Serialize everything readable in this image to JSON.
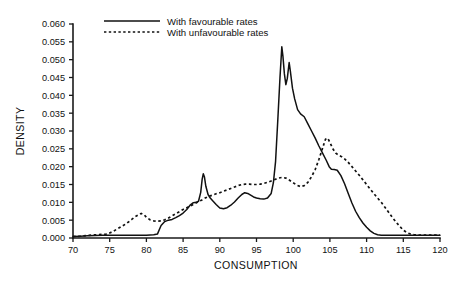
{
  "chart_data": {
    "type": "line",
    "title": "",
    "xlabel": "CONSUMPTION",
    "ylabel": "DENSITY",
    "xlim": [
      70,
      120
    ],
    "ylim": [
      0.0,
      0.06
    ],
    "grid": false,
    "legend_position": "top-center",
    "xticks": [
      70,
      75,
      80,
      85,
      90,
      95,
      100,
      105,
      110,
      115,
      120
    ],
    "xtick_labels": [
      "70",
      "75",
      "80",
      "85",
      "90",
      "95",
      "100",
      "105",
      "110",
      "115",
      "120"
    ],
    "yticks": [
      0.0,
      0.005,
      0.01,
      0.015,
      0.02,
      0.025,
      0.03,
      0.035,
      0.04,
      0.045,
      0.05,
      0.055,
      0.06
    ],
    "ytick_labels": [
      "0.000",
      "0.005",
      "0.010",
      "0.015",
      "0.020",
      "0.025",
      "0.030",
      "0.035",
      "0.040",
      "0.045",
      "0.050",
      "0.055",
      "0.060"
    ],
    "series": [
      {
        "name": "With favourable rates",
        "style": "solid",
        "color": "#111111",
        "points": [
          [
            70.0,
            0.0004
          ],
          [
            71.0,
            0.0005
          ],
          [
            72.0,
            0.0006
          ],
          [
            73.0,
            0.0007
          ],
          [
            74.0,
            0.0008
          ],
          [
            75.0,
            0.0008
          ],
          [
            76.0,
            0.0008
          ],
          [
            77.0,
            0.0008
          ],
          [
            78.0,
            0.0008
          ],
          [
            79.0,
            0.0008
          ],
          [
            80.0,
            0.0008
          ],
          [
            81.0,
            0.0009
          ],
          [
            81.5,
            0.0011
          ],
          [
            82.0,
            0.0035
          ],
          [
            82.5,
            0.0046
          ],
          [
            83.0,
            0.005
          ],
          [
            83.5,
            0.0052
          ],
          [
            84.0,
            0.0057
          ],
          [
            84.5,
            0.0063
          ],
          [
            85.0,
            0.007
          ],
          [
            85.5,
            0.008
          ],
          [
            86.0,
            0.0093
          ],
          [
            86.4,
            0.0099
          ],
          [
            86.8,
            0.01
          ],
          [
            87.1,
            0.0103
          ],
          [
            87.4,
            0.0128
          ],
          [
            87.6,
            0.0165
          ],
          [
            87.75,
            0.018
          ],
          [
            87.9,
            0.0172
          ],
          [
            88.1,
            0.0145
          ],
          [
            88.4,
            0.0122
          ],
          [
            88.7,
            0.0112
          ],
          [
            89.0,
            0.0105
          ],
          [
            89.5,
            0.0094
          ],
          [
            90.0,
            0.0084
          ],
          [
            90.5,
            0.0082
          ],
          [
            91.0,
            0.0085
          ],
          [
            91.5,
            0.0092
          ],
          [
            92.0,
            0.0101
          ],
          [
            92.5,
            0.0112
          ],
          [
            93.0,
            0.0122
          ],
          [
            93.4,
            0.0127
          ],
          [
            93.8,
            0.0125
          ],
          [
            94.2,
            0.012
          ],
          [
            94.6,
            0.0115
          ],
          [
            95.0,
            0.0112
          ],
          [
            95.5,
            0.011
          ],
          [
            96.0,
            0.0109
          ],
          [
            96.5,
            0.0112
          ],
          [
            97.0,
            0.0125
          ],
          [
            97.3,
            0.0155
          ],
          [
            97.6,
            0.0215
          ],
          [
            97.9,
            0.033
          ],
          [
            98.2,
            0.045
          ],
          [
            98.45,
            0.0536
          ],
          [
            98.6,
            0.051
          ],
          [
            98.8,
            0.046
          ],
          [
            99.0,
            0.043
          ],
          [
            99.2,
            0.0448
          ],
          [
            99.45,
            0.0492
          ],
          [
            99.6,
            0.047
          ],
          [
            99.9,
            0.042
          ],
          [
            100.2,
            0.039
          ],
          [
            100.6,
            0.036
          ],
          [
            101.0,
            0.0348
          ],
          [
            101.5,
            0.034
          ],
          [
            102.0,
            0.032
          ],
          [
            102.5,
            0.03
          ],
          [
            103.0,
            0.028
          ],
          [
            103.5,
            0.0258
          ],
          [
            104.0,
            0.0238
          ],
          [
            104.5,
            0.0218
          ],
          [
            104.9,
            0.02
          ],
          [
            105.2,
            0.0193
          ],
          [
            105.6,
            0.0192
          ],
          [
            106.0,
            0.019
          ],
          [
            106.5,
            0.0175
          ],
          [
            107.0,
            0.0152
          ],
          [
            107.5,
            0.0125
          ],
          [
            108.0,
            0.0098
          ],
          [
            108.5,
            0.0075
          ],
          [
            109.0,
            0.0057
          ],
          [
            109.5,
            0.0042
          ],
          [
            110.0,
            0.003
          ],
          [
            110.5,
            0.002
          ],
          [
            111.0,
            0.0013
          ],
          [
            111.5,
            0.0009
          ],
          [
            112.0,
            0.0008
          ],
          [
            113.0,
            0.0008
          ],
          [
            114.0,
            0.0008
          ],
          [
            115.0,
            0.0008
          ],
          [
            116.0,
            0.0008
          ],
          [
            117.0,
            0.0008
          ],
          [
            118.0,
            0.0008
          ],
          [
            119.0,
            0.0008
          ],
          [
            120.0,
            0.0008
          ]
        ]
      },
      {
        "name": "With unfavourable rates",
        "style": "dotted",
        "color": "#111111",
        "points": [
          [
            70.0,
            0.0004
          ],
          [
            71.0,
            0.0005
          ],
          [
            72.0,
            0.0007
          ],
          [
            73.0,
            0.0009
          ],
          [
            74.0,
            0.001
          ],
          [
            74.5,
            0.0011
          ],
          [
            75.0,
            0.0014
          ],
          [
            75.5,
            0.0019
          ],
          [
            76.0,
            0.0025
          ],
          [
            76.5,
            0.0031
          ],
          [
            77.0,
            0.0037
          ],
          [
            77.5,
            0.0044
          ],
          [
            78.0,
            0.0052
          ],
          [
            78.5,
            0.006
          ],
          [
            79.0,
            0.0066
          ],
          [
            79.3,
            0.0069
          ],
          [
            79.7,
            0.0065
          ],
          [
            80.0,
            0.0058
          ],
          [
            80.5,
            0.0051
          ],
          [
            81.0,
            0.0048
          ],
          [
            81.5,
            0.0047
          ],
          [
            82.0,
            0.0048
          ],
          [
            82.5,
            0.0051
          ],
          [
            83.0,
            0.0056
          ],
          [
            83.5,
            0.0062
          ],
          [
            84.0,
            0.0068
          ],
          [
            84.5,
            0.0074
          ],
          [
            85.0,
            0.008
          ],
          [
            85.5,
            0.0085
          ],
          [
            86.0,
            0.009
          ],
          [
            86.5,
            0.0095
          ],
          [
            87.0,
            0.0101
          ],
          [
            87.5,
            0.0106
          ],
          [
            88.0,
            0.0112
          ],
          [
            88.5,
            0.0117
          ],
          [
            89.0,
            0.012
          ],
          [
            89.5,
            0.0124
          ],
          [
            90.0,
            0.0127
          ],
          [
            90.5,
            0.0131
          ],
          [
            91.0,
            0.0135
          ],
          [
            91.5,
            0.0139
          ],
          [
            92.0,
            0.0143
          ],
          [
            92.5,
            0.0147
          ],
          [
            93.0,
            0.015
          ],
          [
            93.5,
            0.0151
          ],
          [
            94.0,
            0.0151
          ],
          [
            94.5,
            0.015
          ],
          [
            95.0,
            0.015
          ],
          [
            95.5,
            0.0151
          ],
          [
            96.0,
            0.0153
          ],
          [
            96.5,
            0.0156
          ],
          [
            97.0,
            0.016
          ],
          [
            97.5,
            0.0164
          ],
          [
            98.0,
            0.0168
          ],
          [
            98.5,
            0.017
          ],
          [
            99.0,
            0.0168
          ],
          [
            99.5,
            0.0162
          ],
          [
            100.0,
            0.0155
          ],
          [
            100.5,
            0.0148
          ],
          [
            101.0,
            0.0144
          ],
          [
            101.5,
            0.0147
          ],
          [
            102.0,
            0.0156
          ],
          [
            102.5,
            0.0172
          ],
          [
            103.0,
            0.0192
          ],
          [
            103.5,
            0.022
          ],
          [
            104.0,
            0.0252
          ],
          [
            104.4,
            0.0277
          ],
          [
            104.7,
            0.028
          ],
          [
            105.0,
            0.0268
          ],
          [
            105.4,
            0.025
          ],
          [
            105.8,
            0.0238
          ],
          [
            106.2,
            0.0232
          ],
          [
            106.6,
            0.0228
          ],
          [
            107.0,
            0.0222
          ],
          [
            107.5,
            0.0212
          ],
          [
            108.0,
            0.02
          ],
          [
            108.5,
            0.0188
          ],
          [
            109.0,
            0.0176
          ],
          [
            109.5,
            0.0163
          ],
          [
            110.0,
            0.015
          ],
          [
            110.5,
            0.0137
          ],
          [
            111.0,
            0.0124
          ],
          [
            111.5,
            0.0112
          ],
          [
            112.0,
            0.01
          ],
          [
            112.5,
            0.0086
          ],
          [
            113.0,
            0.0072
          ],
          [
            113.5,
            0.0058
          ],
          [
            114.0,
            0.0045
          ],
          [
            114.5,
            0.0033
          ],
          [
            115.0,
            0.0022
          ],
          [
            115.5,
            0.0015
          ],
          [
            116.0,
            0.0011
          ],
          [
            116.5,
            0.0009
          ],
          [
            117.0,
            0.0008
          ],
          [
            118.0,
            0.0008
          ],
          [
            119.0,
            0.0008
          ],
          [
            120.0,
            0.0008
          ]
        ]
      }
    ],
    "legend": [
      {
        "label": "With favourable rates",
        "style": "solid"
      },
      {
        "label": "With unfavourable rates",
        "style": "dotted"
      }
    ]
  }
}
